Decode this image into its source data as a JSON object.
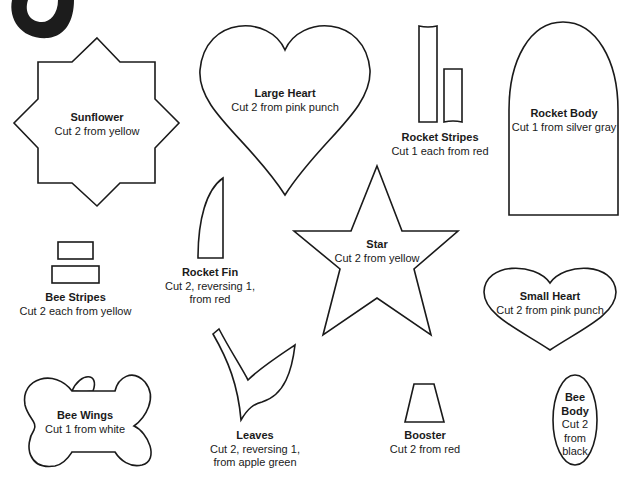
{
  "corner_graphic": {
    "description": "black curved ring fragment",
    "color": "#1c1c1c"
  },
  "patterns": [
    {
      "id": "sunflower",
      "name": "Sunflower",
      "instructions": [
        "Cut 2 from yellow"
      ]
    },
    {
      "id": "large-heart",
      "name": "Large Heart",
      "instructions": [
        "Cut 2 from pink punch"
      ]
    },
    {
      "id": "rocket-stripes",
      "name": "Rocket Stripes",
      "instructions": [
        "Cut 1 each from red"
      ]
    },
    {
      "id": "rocket-body",
      "name": "Rocket Body",
      "instructions": [
        "Cut 1 from silver gray"
      ]
    },
    {
      "id": "rocket-fin",
      "name": "Rocket Fin",
      "instructions": [
        "Cut 2, reversing 1,",
        "from red"
      ]
    },
    {
      "id": "star",
      "name": "Star",
      "instructions": [
        "Cut 2 from yellow"
      ]
    },
    {
      "id": "bee-stripes",
      "name": "Bee Stripes",
      "instructions": [
        "Cut 2 each from yellow"
      ]
    },
    {
      "id": "small-heart",
      "name": "Small Heart",
      "instructions": [
        "Cut 2 from pink punch"
      ]
    },
    {
      "id": "bee-wings",
      "name": "Bee Wings",
      "instructions": [
        "Cut 1 from white"
      ]
    },
    {
      "id": "leaves",
      "name": "Leaves",
      "instructions": [
        "Cut 2, reversing 1,",
        "from apple green"
      ]
    },
    {
      "id": "booster",
      "name": "Booster",
      "instructions": [
        "Cut 2 from red"
      ]
    },
    {
      "id": "bee-body",
      "name": "Bee",
      "name2": "Body",
      "instructions": [
        "Cut 2",
        "from",
        "black"
      ]
    }
  ]
}
